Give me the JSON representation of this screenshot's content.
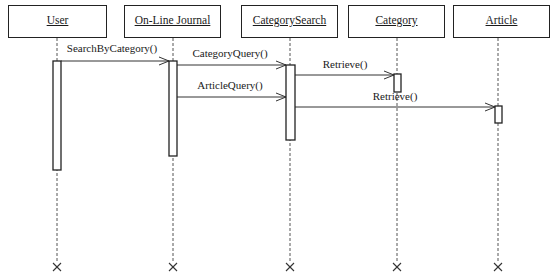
{
  "diagram": {
    "type": "UML sequence diagram",
    "objects": [
      {
        "id": "user",
        "label": "User",
        "box": [
          8,
          5,
          99,
          33
        ],
        "lifeline_x": 57
      },
      {
        "id": "online-journal",
        "label": "On-Line Journal",
        "box": [
          124,
          5,
          97,
          33
        ],
        "lifeline_x": 173
      },
      {
        "id": "category-search",
        "label": "CategorySearch",
        "box": [
          241,
          5,
          97,
          33
        ],
        "lifeline_x": 290
      },
      {
        "id": "category",
        "label": "Category",
        "box": [
          348,
          5,
          97,
          33
        ],
        "lifeline_x": 397
      },
      {
        "id": "article",
        "label": "Article",
        "box": [
          453,
          5,
          97,
          33
        ],
        "lifeline_x": 498
      }
    ],
    "activations": [
      {
        "object": "user",
        "x": 53,
        "y": 61,
        "w": 8,
        "h": 109
      },
      {
        "object": "online-journal",
        "x": 169,
        "y": 61,
        "w": 8,
        "h": 95
      },
      {
        "object": "category-search",
        "x": 286,
        "y": 65,
        "w": 9,
        "h": 75
      },
      {
        "object": "category",
        "x": 394,
        "y": 74,
        "w": 7,
        "h": 18
      },
      {
        "object": "article",
        "x": 495,
        "y": 106,
        "w": 7,
        "h": 17
      }
    ],
    "messages": [
      {
        "label": "SearchByCategory()",
        "from_x": 61,
        "to_x": 169,
        "y": 61,
        "label_x": 112,
        "label_y": 42
      },
      {
        "label": "CategoryQuery()",
        "from_x": 177,
        "to_x": 286,
        "y": 65,
        "label_x": 230,
        "label_y": 47
      },
      {
        "label": "Retrieve()",
        "from_x": 295,
        "to_x": 394,
        "y": 75,
        "label_x": 345,
        "label_y": 58
      },
      {
        "label": "ArticleQuery()",
        "from_x": 177,
        "to_x": 286,
        "y": 97,
        "label_x": 230,
        "label_y": 79
      },
      {
        "label": "Retrieve()",
        "from_x": 295,
        "to_x": 495,
        "y": 107,
        "label_x": 395,
        "label_y": 90
      }
    ],
    "lifeline_top": 38,
    "lifeline_end_y": 267,
    "destroy_marker": "×"
  }
}
